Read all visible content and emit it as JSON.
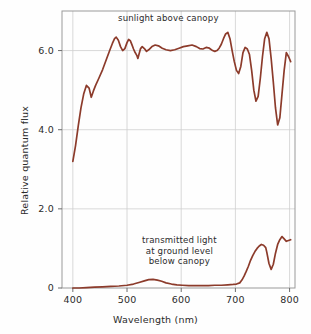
{
  "chart_data": {
    "type": "line",
    "title": "",
    "xlabel": "Wavelength (nm)",
    "ylabel": "Relative quantum flux",
    "xlim": [
      380,
      810
    ],
    "ylim": [
      0,
      7.0
    ],
    "xticks": [
      "400",
      "500",
      "600",
      "700",
      "800"
    ],
    "xtick_values": [
      400,
      500,
      600,
      700,
      800
    ],
    "yticks": [
      "0",
      "2.0",
      "4.0",
      "6.0"
    ],
    "ytick_values": [
      0,
      2.0,
      4.0,
      6.0
    ],
    "grid": true,
    "legend": "none",
    "line_color": "#8c3b2b",
    "annotations": [
      {
        "text": "sunlight above canopy",
        "x": 585,
        "y": 6.75
      },
      {
        "text_lines": [
          "transmitted light",
          "at ground level",
          "below canopy"
        ],
        "x": 600,
        "y": 1.85
      }
    ],
    "series": [
      {
        "name": "sunlight above canopy",
        "x": [
          400,
          405,
          410,
          415,
          420,
          425,
          430,
          434,
          438,
          442,
          448,
          455,
          462,
          468,
          473,
          477,
          480,
          484,
          488,
          492,
          496,
          500,
          503,
          506,
          509,
          512,
          515,
          518,
          520,
          522,
          525,
          528,
          532,
          536,
          540,
          546,
          552,
          558,
          565,
          572,
          580,
          588,
          596,
          604,
          612,
          620,
          628,
          634,
          640,
          646,
          652,
          658,
          662,
          666,
          670,
          674,
          678,
          682,
          686,
          690,
          694,
          698,
          702,
          706,
          710,
          714,
          718,
          722,
          726,
          730,
          734,
          738,
          742,
          746,
          750,
          754,
          758,
          762,
          766,
          770,
          774,
          778,
          782,
          786,
          790,
          794,
          798,
          802
        ],
        "y": [
          3.2,
          3.6,
          4.1,
          4.55,
          4.9,
          5.12,
          5.05,
          4.82,
          4.98,
          5.12,
          5.3,
          5.52,
          5.78,
          6.0,
          6.18,
          6.3,
          6.34,
          6.26,
          6.1,
          6.0,
          6.05,
          6.2,
          6.28,
          6.25,
          6.15,
          6.04,
          5.95,
          5.88,
          5.8,
          5.9,
          6.05,
          6.1,
          6.05,
          5.98,
          6.02,
          6.1,
          6.14,
          6.12,
          6.06,
          6.02,
          6.0,
          6.02,
          6.06,
          6.1,
          6.12,
          6.14,
          6.1,
          6.05,
          6.04,
          6.08,
          6.06,
          6.0,
          5.98,
          6.0,
          6.06,
          6.16,
          6.3,
          6.42,
          6.46,
          6.3,
          6.0,
          5.72,
          5.5,
          5.42,
          5.6,
          5.95,
          6.08,
          6.04,
          5.9,
          5.5,
          5.0,
          4.72,
          4.84,
          5.3,
          5.85,
          6.3,
          6.46,
          6.3,
          5.8,
          5.2,
          4.55,
          4.12,
          4.3,
          4.9,
          5.5,
          5.95,
          5.85,
          5.72
        ]
      },
      {
        "name": "transmitted light at ground level below canopy",
        "x": [
          400,
          412,
          425,
          440,
          455,
          470,
          485,
          500,
          512,
          522,
          532,
          540,
          548,
          556,
          564,
          572,
          582,
          592,
          602,
          614,
          626,
          638,
          650,
          662,
          674,
          686,
          696,
          702,
          708,
          712,
          716,
          720,
          724,
          728,
          732,
          736,
          740,
          744,
          748,
          752,
          756,
          758,
          762,
          766,
          770,
          774,
          778,
          782,
          786,
          790,
          794,
          798,
          802
        ],
        "y": [
          0.0,
          0.0,
          0.01,
          0.02,
          0.03,
          0.04,
          0.05,
          0.07,
          0.1,
          0.14,
          0.18,
          0.21,
          0.22,
          0.2,
          0.17,
          0.13,
          0.1,
          0.08,
          0.07,
          0.06,
          0.06,
          0.06,
          0.06,
          0.07,
          0.07,
          0.08,
          0.09,
          0.1,
          0.13,
          0.2,
          0.3,
          0.42,
          0.55,
          0.7,
          0.82,
          0.92,
          1.0,
          1.06,
          1.1,
          1.08,
          1.02,
          0.9,
          0.62,
          0.47,
          0.6,
          0.88,
          1.1,
          1.22,
          1.3,
          1.24,
          1.18,
          1.2,
          1.22
        ]
      }
    ]
  }
}
